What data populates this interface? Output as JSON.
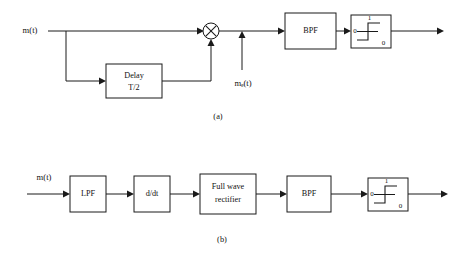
{
  "figure": {
    "background_color": "#ffffff",
    "line_color": "#1a1a1a",
    "text_color": "#111111"
  },
  "diagram_a": {
    "caption": "(a)",
    "input_label": "m(t)",
    "secondary_input_label": "mₑ(t)",
    "blocks": [
      {
        "id": "delay",
        "line1": "Delay",
        "line2": "T/2"
      },
      {
        "id": "bpf",
        "line1": "BPF",
        "line2": ""
      },
      {
        "id": "comparator",
        "line1": "",
        "line2": ""
      }
    ],
    "multiplier_symbol": "⊗",
    "comparator": {
      "high_label": "1",
      "low_left_label": "0",
      "low_right_label": "0"
    }
  },
  "diagram_b": {
    "caption": "(b)",
    "input_label": "m(t)",
    "blocks": [
      {
        "id": "lpf",
        "line1": "LPF",
        "line2": ""
      },
      {
        "id": "differentiator",
        "line1": "d/dt",
        "line2": ""
      },
      {
        "id": "rectifier",
        "line1": "Full wave",
        "line2": "rectifier"
      },
      {
        "id": "bpf",
        "line1": "BPF",
        "line2": ""
      },
      {
        "id": "comparator",
        "line1": "",
        "line2": ""
      }
    ],
    "comparator": {
      "high_label": "1",
      "low_left_label": "0",
      "low_right_label": "0"
    }
  }
}
